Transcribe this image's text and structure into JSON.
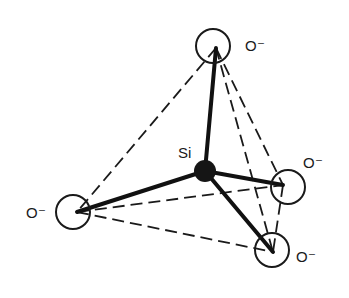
{
  "diagram": {
    "colors": {
      "ink": "#1a1a1a",
      "background": "#ffffff"
    },
    "silicon": {
      "label": "Si",
      "cx": 205,
      "cy": 171,
      "r": 11,
      "label_x": 178,
      "label_y": 158
    },
    "oxygens": [
      {
        "id": "top",
        "label": "O⁻",
        "cx": 213,
        "cy": 46,
        "r": 17,
        "vx": 216,
        "vy": 48,
        "label_x": 245,
        "label_y": 51
      },
      {
        "id": "left",
        "label": "O⁻",
        "cx": 73,
        "cy": 212,
        "r": 17,
        "vx": 77,
        "vy": 212,
        "label_x": 26,
        "label_y": 218
      },
      {
        "id": "right",
        "label": "O⁻",
        "cx": 288,
        "cy": 187,
        "r": 17,
        "vx": 283,
        "vy": 185,
        "label_x": 303,
        "label_y": 168
      },
      {
        "id": "bottom",
        "label": "O⁻",
        "cx": 272,
        "cy": 250,
        "r": 17,
        "vx": 273,
        "vy": 252,
        "label_x": 296,
        "label_y": 262
      }
    ],
    "bonds": [
      {
        "from": "silicon",
        "to": "top"
      },
      {
        "from": "silicon",
        "to": "left"
      },
      {
        "from": "silicon",
        "to": "right"
      },
      {
        "from": "silicon",
        "to": "bottom"
      }
    ],
    "edges": [
      {
        "from": "top",
        "to": "left"
      },
      {
        "from": "top",
        "to": "right"
      },
      {
        "from": "top",
        "to": "bottom"
      },
      {
        "from": "left",
        "to": "right"
      },
      {
        "from": "left",
        "to": "bottom"
      },
      {
        "from": "right",
        "to": "bottom"
      }
    ]
  }
}
